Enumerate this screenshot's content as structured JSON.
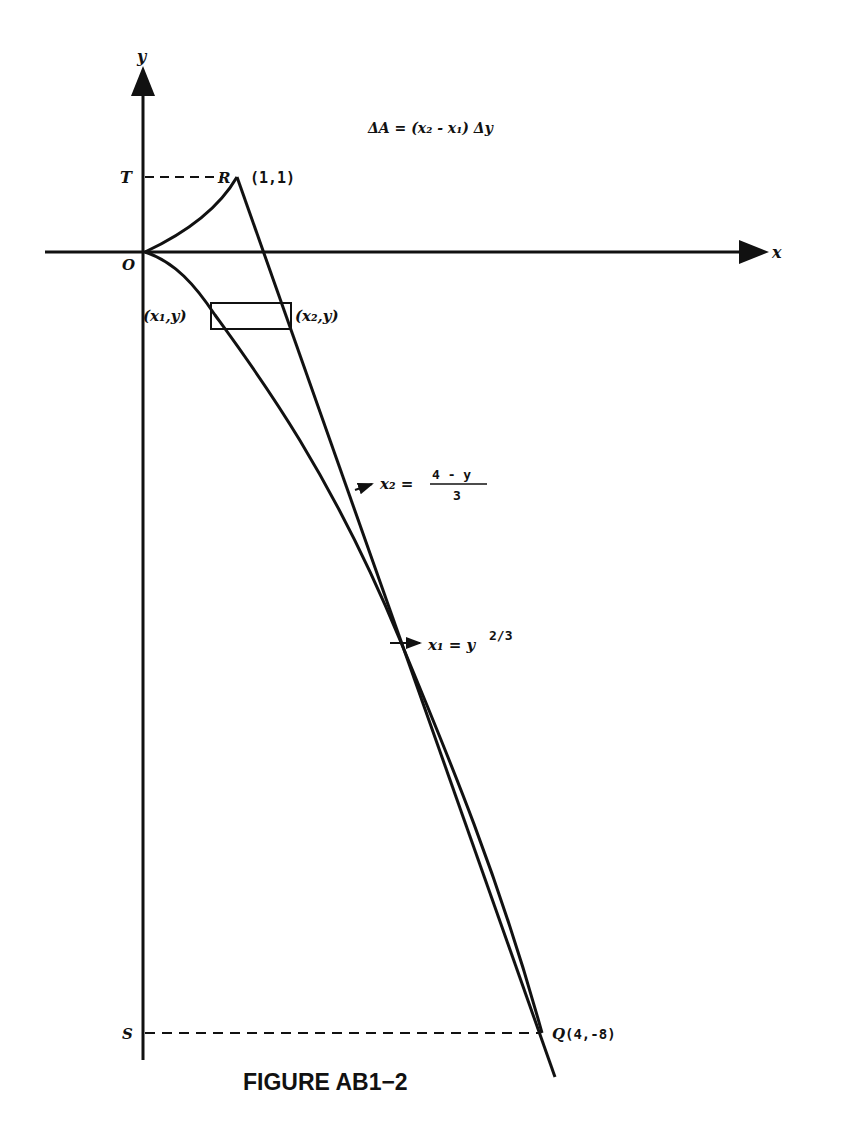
{
  "figure": {
    "caption": "FIGURE AB1−2",
    "axes": {
      "x_label": "x",
      "y_label": "y",
      "origin_label": "O"
    },
    "points": {
      "R": {
        "label": "R",
        "coords": "(1,1)"
      },
      "T": {
        "label": "T"
      },
      "S": {
        "label": "S"
      },
      "Q": {
        "label": "Q",
        "coords": "(4,-8)"
      }
    },
    "strip": {
      "left_label": "(x₁,y)",
      "right_label": "(x₂,y)"
    },
    "formulas": {
      "area": "ΔA = (x₂ - x₁) Δy",
      "x2_lhs": "x₂ =",
      "x2_num": "4 - y",
      "x2_den": "3",
      "x1_lhs": "x₁ = y",
      "x1_exp": "2/3"
    }
  }
}
